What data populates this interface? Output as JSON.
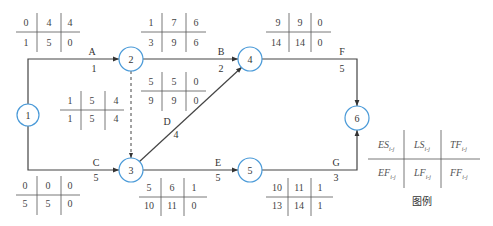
{
  "diagram": {
    "type": "arrow-network-six-parameter",
    "nodes": [
      {
        "id": "1",
        "label": "1",
        "cx": 28,
        "cy": 115
      },
      {
        "id": "2",
        "label": "2",
        "cx": 131,
        "cy": 59
      },
      {
        "id": "3",
        "label": "3",
        "cx": 131,
        "cy": 170
      },
      {
        "id": "4",
        "label": "4",
        "cx": 250,
        "cy": 59
      },
      {
        "id": "5",
        "label": "5",
        "cx": 250,
        "cy": 170
      },
      {
        "id": "6",
        "label": "6",
        "cx": 357,
        "cy": 118
      }
    ],
    "activities": [
      {
        "name": "A",
        "duration": "1",
        "from": "1",
        "to": "2",
        "params": {
          "ES": "0",
          "LS": "4",
          "TF": "4",
          "EF": "1",
          "LF": "5",
          "FF": "0"
        }
      },
      {
        "name": "B",
        "duration": "2",
        "from": "2",
        "to": "4",
        "params": {
          "ES": "1",
          "LS": "7",
          "TF": "6",
          "EF": "3",
          "LF": "9",
          "FF": "6"
        }
      },
      {
        "name": "dummy",
        "duration": "",
        "from": "2",
        "to": "3",
        "dashed": true,
        "params": {
          "ES": "1",
          "LS": "5",
          "TF": "4",
          "EF": "1",
          "LF": "5",
          "FF": "4"
        }
      },
      {
        "name": "C",
        "duration": "5",
        "from": "1",
        "to": "3",
        "params": {
          "ES": "0",
          "LS": "0",
          "TF": "0",
          "EF": "5",
          "LF": "5",
          "FF": "0"
        }
      },
      {
        "name": "D",
        "duration": "4",
        "from": "3",
        "to": "4",
        "params": {
          "ES": "5",
          "LS": "5",
          "TF": "0",
          "EF": "9",
          "LF": "9",
          "FF": "0"
        }
      },
      {
        "name": "E",
        "duration": "5",
        "from": "3",
        "to": "5",
        "params": {
          "ES": "5",
          "LS": "6",
          "TF": "1",
          "EF": "10",
          "LF": "11",
          "FF": "0"
        }
      },
      {
        "name": "F",
        "duration": "5",
        "from": "4",
        "to": "6",
        "params": {
          "ES": "9",
          "LS": "9",
          "TF": "0",
          "EF": "14",
          "LF": "14",
          "FF": "0"
        }
      },
      {
        "name": "G",
        "duration": "3",
        "from": "5",
        "to": "6",
        "params": {
          "ES": "10",
          "LS": "11",
          "TF": "1",
          "EF": "13",
          "LF": "14",
          "FF": "1"
        }
      }
    ],
    "legend": {
      "cells": [
        "ES",
        "LS",
        "TF",
        "EF",
        "LF",
        "FF"
      ],
      "subscript": "i-j",
      "caption": "图例"
    },
    "colors": {
      "node_stroke": "#4a9ad8",
      "line": "#333333",
      "grid": "#555555"
    }
  },
  "labels": {
    "A": "A",
    "A_dur": "1",
    "B": "B",
    "B_dur": "2",
    "C": "C",
    "C_dur": "5",
    "D": "D",
    "D_dur": "4",
    "E": "E",
    "E_dur": "5",
    "F": "F",
    "F_dur": "5",
    "G": "G",
    "G_dur": "3"
  },
  "tables": {
    "A": [
      "0",
      "4",
      "4",
      "1",
      "5",
      "0"
    ],
    "B": [
      "1",
      "7",
      "6",
      "3",
      "9",
      "6"
    ],
    "dummy": [
      "1",
      "5",
      "4",
      "1",
      "5",
      "4"
    ],
    "C": [
      "0",
      "0",
      "0",
      "5",
      "5",
      "0"
    ],
    "D": [
      "5",
      "5",
      "0",
      "9",
      "9",
      "0"
    ],
    "E": [
      "5",
      "6",
      "1",
      "10",
      "11",
      "0"
    ],
    "F": [
      "9",
      "9",
      "0",
      "14",
      "14",
      "0"
    ],
    "G": [
      "10",
      "11",
      "1",
      "13",
      "14",
      "1"
    ]
  },
  "node_labels": [
    "1",
    "2",
    "3",
    "4",
    "5",
    "6"
  ],
  "legend": {
    "ES": "ES",
    "LS": "LS",
    "TF": "TF",
    "EF": "EF",
    "LF": "LF",
    "FF": "FF",
    "sub": "i-j",
    "caption": "图例"
  }
}
